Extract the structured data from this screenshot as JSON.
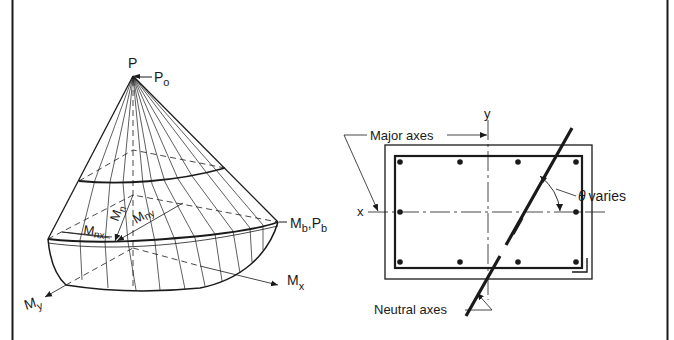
{
  "figure": {
    "left_panel": {
      "title": "Interaction surface (failure surface) for biaxial bending",
      "labels": {
        "apex": "P",
        "apex_load": "P",
        "apex_load_sub": "o",
        "balanced_m": "M",
        "balanced_m_sub": "b",
        "balanced_sep": ",",
        "balanced_p": "P",
        "balanced_p_sub": "b",
        "mx": "M",
        "mx_sub": "x",
        "my": "M",
        "my_sub": "y",
        "mn": "M",
        "mn_sub": "n",
        "mnx": "M",
        "mnx_sub": "nx",
        "mny": "M",
        "mny_sub": "ny"
      }
    },
    "right_panel": {
      "title": "Column section with inclined neutral axis",
      "labels": {
        "major_axes": "Major axes",
        "y_axis": "y",
        "x_axis": "x",
        "theta": "θ",
        "theta_text": "varies",
        "neutral_axes": "Neutral axes"
      },
      "rebar_count": 10
    },
    "colors": {
      "ink": "#1a1a1a",
      "background": "#ffffff"
    }
  }
}
